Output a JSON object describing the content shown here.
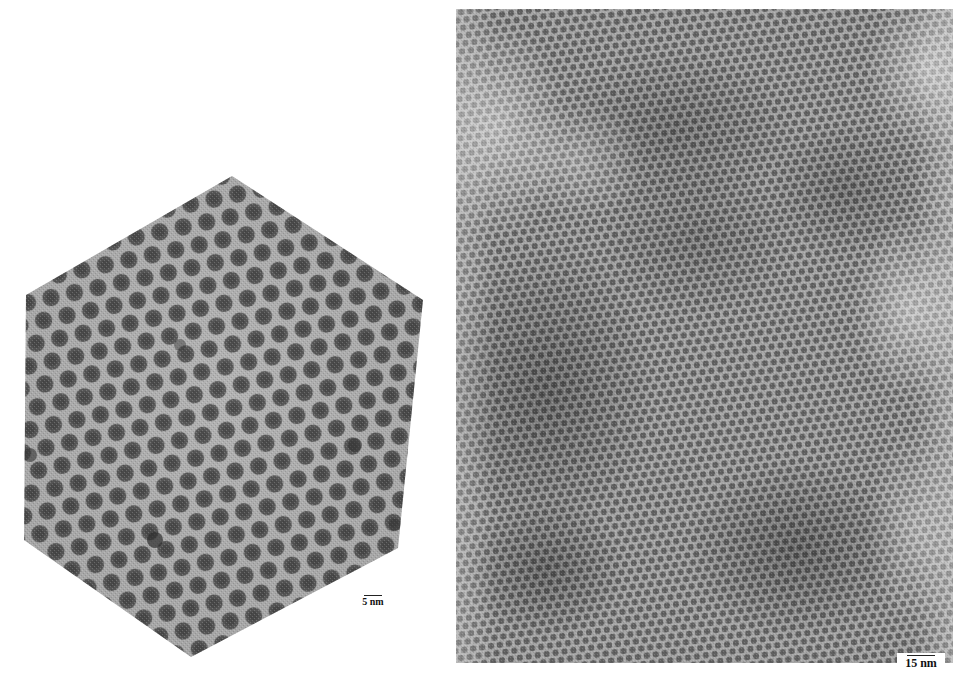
{
  "figure": {
    "panels": [
      {
        "id": "left",
        "shape": "hexagon",
        "content": "close-packed nanoparticle monolayer, hexagonal lattice",
        "scale_bar": {
          "label": "5 nm"
        }
      },
      {
        "id": "right",
        "shape": "rectangle",
        "content": "large-area nanoparticle superlattice with thickness variations",
        "scale_bar": {
          "label": "15 nm"
        }
      }
    ]
  },
  "colors": {
    "background": "#ffffff",
    "matrix_light": "#b4b4b4",
    "particle_dark": "#4a4a4a",
    "shadow_dark": "#3c3c3c"
  }
}
